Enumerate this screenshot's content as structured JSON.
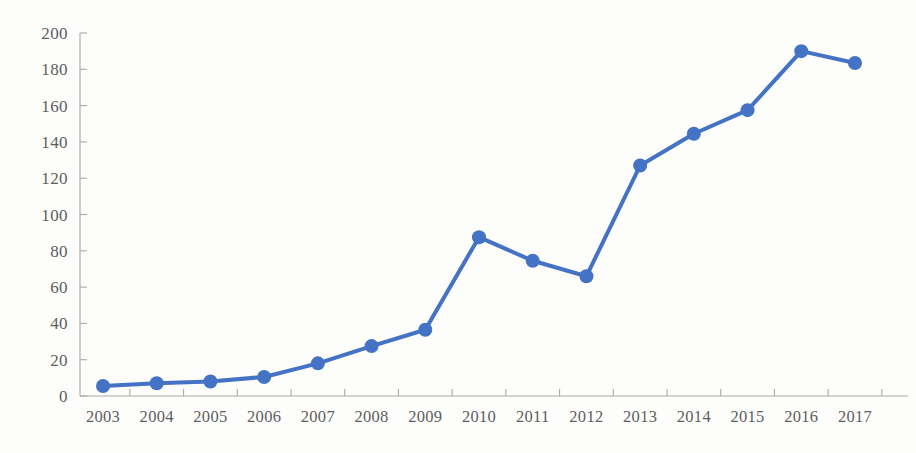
{
  "chart_data": {
    "type": "line",
    "title": "",
    "subtitle": "",
    "xlabel": "",
    "ylabel": "",
    "categories": [
      "2003",
      "2004",
      "2005",
      "2006",
      "2007",
      "2008",
      "2009",
      "2010",
      "2011",
      "2012",
      "2013",
      "2014",
      "2015",
      "2016",
      "2017"
    ],
    "x": [
      2003,
      2004,
      2005,
      2006,
      2007,
      2008,
      2009,
      2010,
      2011,
      2012,
      2013,
      2014,
      2015,
      2016,
      2017
    ],
    "values": [
      5.5,
      7,
      8,
      10.5,
      18,
      27.5,
      36.5,
      87.5,
      74.5,
      66,
      127,
      144.5,
      157.5,
      190,
      183.5
    ],
    "series": [
      {
        "name": "",
        "values": [
          5.5,
          7,
          8,
          10.5,
          18,
          27.5,
          36.5,
          87.5,
          74.5,
          66,
          127,
          144.5,
          157.5,
          190,
          183.5
        ]
      }
    ],
    "ylim": [
      0,
      200
    ],
    "y_ticks": [
      0,
      20,
      40,
      60,
      80,
      100,
      120,
      140,
      160,
      180,
      200
    ],
    "y_tick_labels": [
      "0",
      "20",
      "40",
      "60",
      "80",
      "100",
      "120",
      "140",
      "160",
      "180",
      "200"
    ],
    "grid": false,
    "legend": null,
    "legend_position": "none",
    "annotations": [],
    "marker": "circle",
    "marker_size": 9,
    "line_width": 4
  },
  "colors": {
    "series": "#4472c4",
    "marker": "#4472c4",
    "axis": "#a9a9a9",
    "tick_label": "#5e5e5e",
    "background": "#fdfdfb"
  }
}
